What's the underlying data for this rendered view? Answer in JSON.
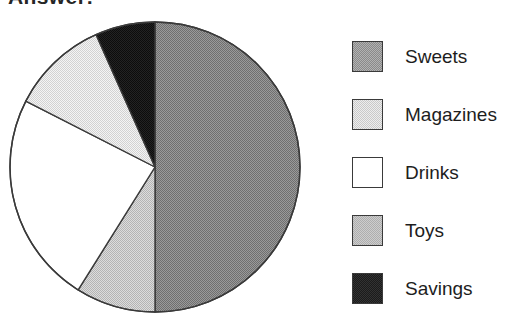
{
  "heading": "Answer:",
  "chart_data": {
    "type": "pie",
    "title": "",
    "legend_position": "right",
    "start_angle_deg": 0,
    "direction": "clockwise",
    "center": {
      "x": 155,
      "y": 167
    },
    "radius": 145,
    "labels": [
      "Sweets",
      "Magazines",
      "Drinks",
      "Toys",
      "Savings"
    ],
    "values": [
      50,
      11,
      24,
      9,
      6
    ],
    "units": "percent",
    "slices": [
      {
        "label": "Sweets",
        "value": 50,
        "color": "#8a8a8a",
        "fill": "dither-medium-gray",
        "start_deg": 0,
        "end_deg": 180
      },
      {
        "label": "Toys",
        "value": 9,
        "color": "#cdcdcd",
        "fill": "dither-light-gray",
        "start_deg": 180,
        "end_deg": 212
      },
      {
        "label": "Drinks",
        "value": 24,
        "color": "#ffffff",
        "fill": "solid-white",
        "start_deg": 212,
        "end_deg": 297
      },
      {
        "label": "Magazines",
        "value": 11,
        "color": "#ededed",
        "fill": "dither-pale-gray",
        "start_deg": 297,
        "end_deg": 336
      },
      {
        "label": "Savings",
        "value": 6,
        "color": "#1b1b1b",
        "fill": "dither-black",
        "start_deg": 336,
        "end_deg": 360
      }
    ],
    "outline_color": "#3a3a3a"
  },
  "legend": {
    "items": [
      {
        "label": "Sweets",
        "swatch": "sw-sweets",
        "icon": "legend-swatch-icon"
      },
      {
        "label": "Magazines",
        "swatch": "sw-magazines",
        "icon": "legend-swatch-icon"
      },
      {
        "label": "Drinks",
        "swatch": "sw-drinks",
        "icon": "legend-swatch-icon"
      },
      {
        "label": "Toys",
        "swatch": "sw-toys",
        "icon": "legend-swatch-icon"
      },
      {
        "label": "Savings",
        "swatch": "sw-savings",
        "icon": "legend-swatch-icon"
      }
    ]
  }
}
